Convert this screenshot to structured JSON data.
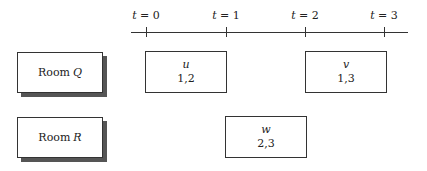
{
  "timeline": {
    "ticks": [
      {
        "var": "t",
        "eq": " = ",
        "value": "0"
      },
      {
        "var": "t",
        "eq": " = ",
        "value": "1"
      },
      {
        "var": "t",
        "eq": " = ",
        "value": "2"
      },
      {
        "var": "t",
        "eq": " = ",
        "value": "3"
      }
    ]
  },
  "rooms": [
    {
      "prefix": "Room",
      "name": "Q"
    },
    {
      "prefix": "Room",
      "name": "R"
    }
  ],
  "tasks": [
    {
      "name": "u",
      "values": "1,2",
      "room": "Q",
      "start": 0,
      "end": 1
    },
    {
      "name": "v",
      "values": "1,3",
      "room": "Q",
      "start": 2,
      "end": 3
    },
    {
      "name": "w",
      "values": "2,3",
      "room": "R",
      "start": 1,
      "end": 2
    }
  ]
}
